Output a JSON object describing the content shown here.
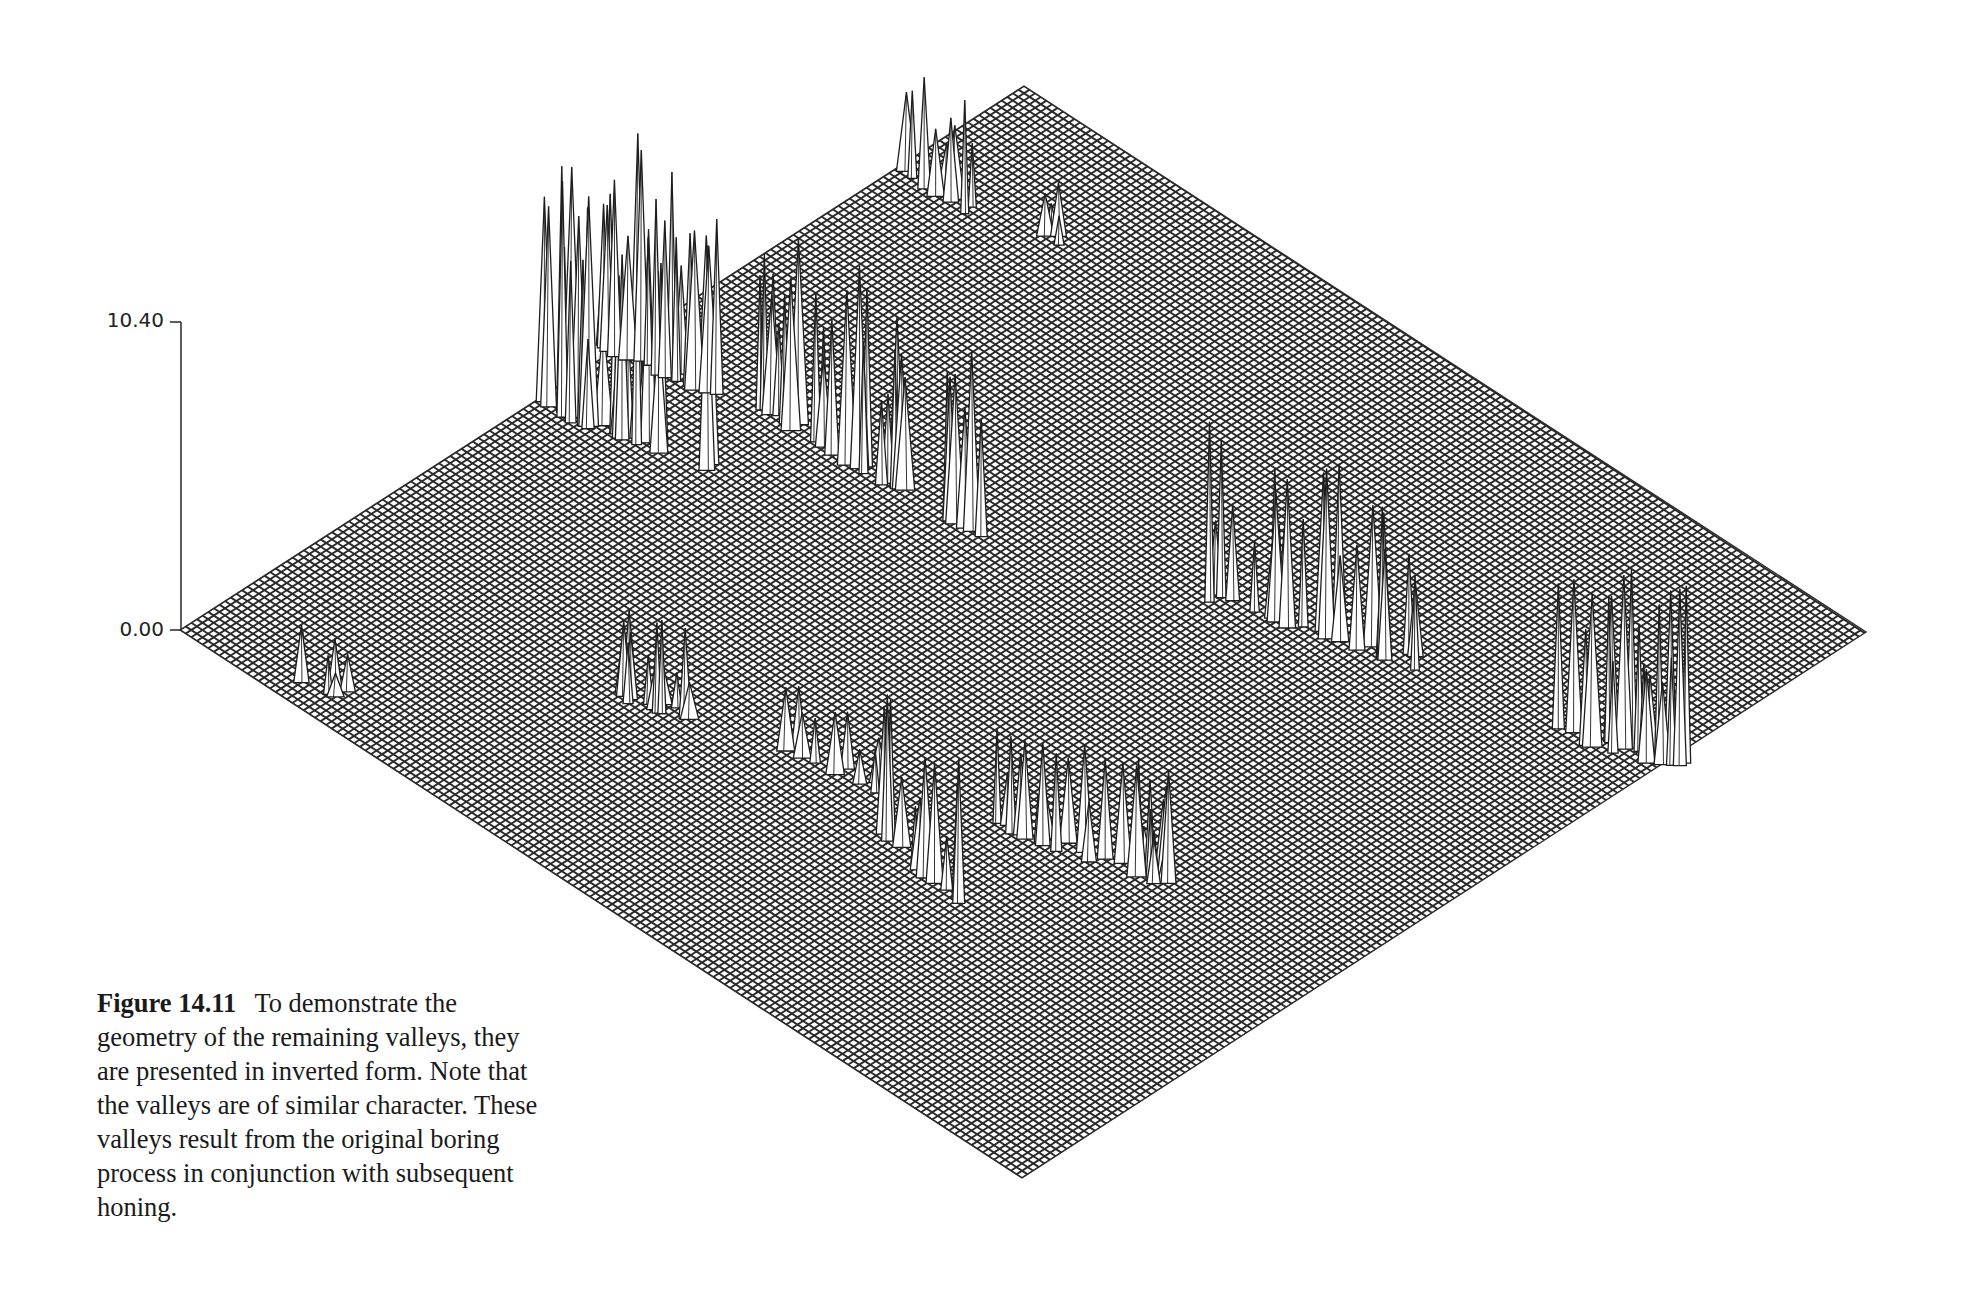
{
  "figure": {
    "number": "Figure 14.11",
    "caption": "To demonstrate the geometry of the remaining valleys, they are presented in inverted form. Note that the valleys are of similar character. These valleys result from the original boring process in conjunction with subsequent honing."
  },
  "axis": {
    "z_max_label": "10.40",
    "z_min_label": "0.00"
  },
  "colors": {
    "mesh_line": "#2a2a2a",
    "mesh_bg": "#ffffff",
    "peak_fill": "#ffffff",
    "peak_stroke": "#1e1e1e",
    "axis": "#333333"
  },
  "chart_data": {
    "type": "surface-3d",
    "zlabel": "",
    "zlim": [
      0.0,
      10.4
    ],
    "z_ticks": [
      "0.00",
      "10.40"
    ],
    "grid": true,
    "legend": null,
    "clusters": [
      {
        "name": "far-top cluster",
        "u": 0.08,
        "v": 0.3,
        "max_height": 6.5
      },
      {
        "name": "far-top small",
        "u": 0.13,
        "v": 0.36,
        "max_height": 2.5
      },
      {
        "name": "upper-left ridge A",
        "u": 0.22,
        "v": 0.02,
        "max_height": 9.5
      },
      {
        "name": "upper-left ridge B",
        "u": 0.33,
        "v": 0.1,
        "max_height": 8.0
      },
      {
        "name": "center-right ridge",
        "u": 0.44,
        "v": 0.55,
        "max_height": 7.5
      },
      {
        "name": "right-edge cluster",
        "u": 0.53,
        "v": 0.86,
        "max_height": 7.0
      },
      {
        "name": "left-near ridge",
        "u": 0.52,
        "v": 0.17,
        "max_height": 4.0
      },
      {
        "name": "front-center ridge",
        "u": 0.74,
        "v": 0.35,
        "max_height": 4.5
      },
      {
        "name": "front-left spikes",
        "u": 0.77,
        "v": 0.26,
        "max_height": 5.5
      },
      {
        "name": "near-left corner spikes",
        "u": 0.04,
        "v": 0.02,
        "max_height": 2.5
      }
    ]
  }
}
